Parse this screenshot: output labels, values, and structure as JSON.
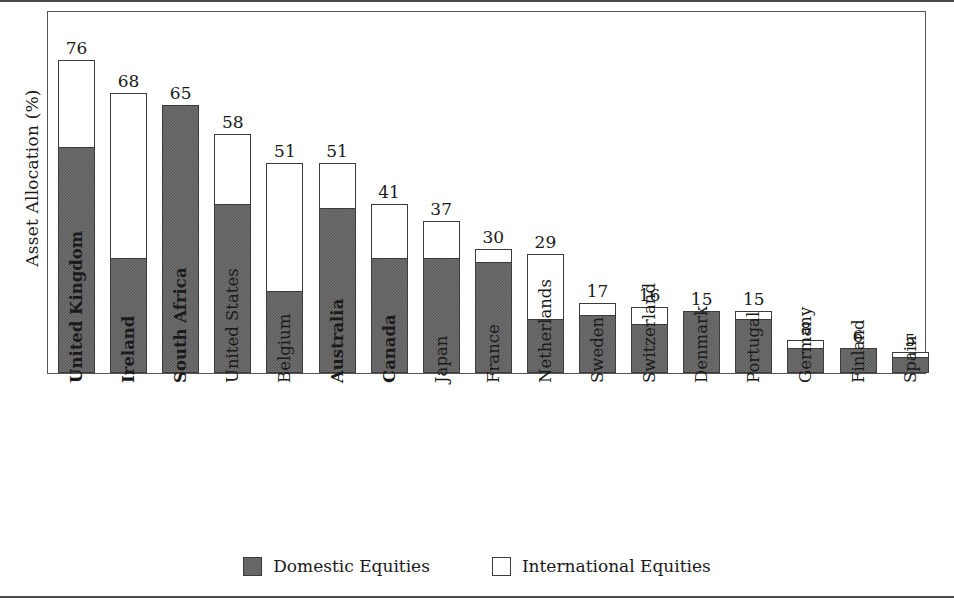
{
  "chart_data": {
    "type": "bar",
    "subtype": "stacked",
    "title": "",
    "xlabel": "",
    "ylabel": "Asset Allocation (%)",
    "ylim": [
      0,
      80
    ],
    "grid": false,
    "legend_position": "bottom-center",
    "categories": [
      "United Kingdom",
      "Ireland",
      "South Africa",
      "United States",
      "Belgium",
      "Australia",
      "Canada",
      "Japan",
      "France",
      "Netherlands",
      "Sweden",
      "Switzerland",
      "Denmark",
      "Portugal",
      "Germany",
      "Finland",
      "Spain"
    ],
    "emphasized_categories": [
      "United Kingdom",
      "Ireland",
      "South Africa",
      "Australia",
      "Canada"
    ],
    "totals": [
      76,
      68,
      65,
      58,
      51,
      51,
      41,
      37,
      30,
      29,
      17,
      16,
      15,
      15,
      8,
      6,
      5
    ],
    "series": [
      {
        "name": "Domestic Equities",
        "color": "#6e6e6e",
        "values": [
          55,
          28,
          65,
          41,
          20,
          40,
          28,
          28,
          27,
          13,
          14,
          12,
          15,
          13,
          6,
          6,
          4
        ]
      },
      {
        "name": "International Equities",
        "color": "#ffffff",
        "values": [
          21,
          40,
          0,
          17,
          31,
          11,
          13,
          9,
          3,
          16,
          3,
          4,
          0,
          2,
          2,
          0,
          1
        ]
      }
    ],
    "bar_labels": [
      "76",
      "68",
      "65",
      "58",
      "51",
      "51",
      "41",
      "37",
      "30",
      "29",
      "17",
      "16",
      "15",
      "15",
      "8",
      "6",
      "5"
    ]
  },
  "legend": {
    "items": [
      {
        "label": "Domestic Equities",
        "swatch": "filled-gray-swatch"
      },
      {
        "label": "International Equities",
        "swatch": "empty-white-swatch"
      }
    ]
  },
  "axes": {
    "y_title": "Asset Allocation (%)"
  }
}
